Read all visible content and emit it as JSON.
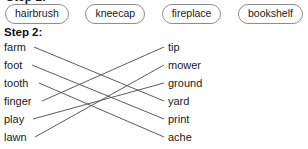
{
  "clipped_heading": "Step 1:",
  "word_bank": {
    "name": "word-bank",
    "pills": [
      {
        "label": "hairbrush"
      },
      {
        "label": "kneecap"
      },
      {
        "label": "fireplace"
      },
      {
        "label": "bookshelf"
      }
    ]
  },
  "step": {
    "label": "Step 2:"
  },
  "matching": {
    "left_column": [
      {
        "label": "farm"
      },
      {
        "label": "foot"
      },
      {
        "label": "tooth"
      },
      {
        "label": "finger"
      },
      {
        "label": "play"
      },
      {
        "label": "lawn"
      }
    ],
    "right_column": [
      {
        "label": "tip"
      },
      {
        "label": "mower"
      },
      {
        "label": "ground"
      },
      {
        "label": "yard"
      },
      {
        "label": "print"
      },
      {
        "label": "ache"
      }
    ],
    "connections": [
      {
        "from": "farm",
        "to": "yard",
        "from_index": 0,
        "to_index": 3
      },
      {
        "from": "foot",
        "to": "print",
        "from_index": 1,
        "to_index": 4
      },
      {
        "from": "tooth",
        "to": "ache",
        "from_index": 2,
        "to_index": 5
      },
      {
        "from": "finger",
        "to": "tip",
        "from_index": 3,
        "to_index": 0
      },
      {
        "from": "play",
        "to": "ground",
        "from_index": 4,
        "to_index": 2
      },
      {
        "from": "lawn",
        "to": "mower",
        "from_index": 5,
        "to_index": 1
      }
    ]
  },
  "colors": {
    "line": "#4a4a4a",
    "pill_border": "#8d8d8d",
    "text": "#1a1a1a",
    "background": "#ffffff"
  }
}
